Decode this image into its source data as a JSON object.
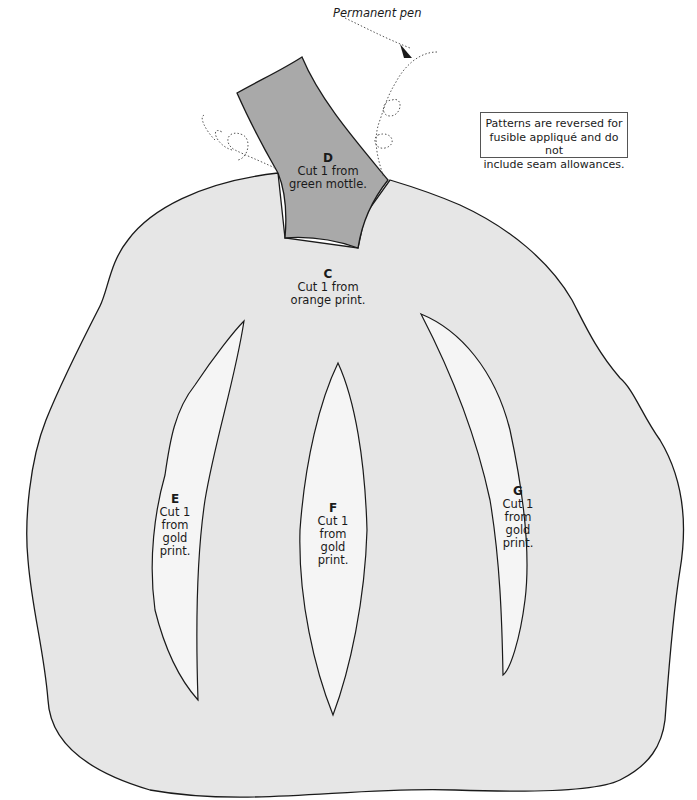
{
  "annotation": {
    "permanent_pen": "Permanent pen"
  },
  "note": {
    "lines": [
      "Patterns are reversed for",
      "fusible appliqué and do not",
      "include seam allowances."
    ]
  },
  "pieces": {
    "C": {
      "letter": "C",
      "lines": [
        "Cut 1 from",
        "orange print."
      ]
    },
    "D": {
      "letter": "D",
      "lines": [
        "Cut 1 from",
        "green mottle."
      ]
    },
    "E": {
      "letter": "E",
      "lines": [
        "Cut 1",
        "from",
        "gold",
        "print."
      ]
    },
    "F": {
      "letter": "F",
      "lines": [
        "Cut 1",
        "from",
        "gold",
        "print."
      ]
    },
    "G": {
      "letter": "G",
      "lines": [
        "Cut 1",
        "from",
        "gold",
        "print."
      ]
    }
  },
  "colors": {
    "pumpkin_fill": "#e6e6e6",
    "stem_fill": "#a9a9a9",
    "rib_fill": "#f5f5f5",
    "outline": "#1a1a1a"
  }
}
